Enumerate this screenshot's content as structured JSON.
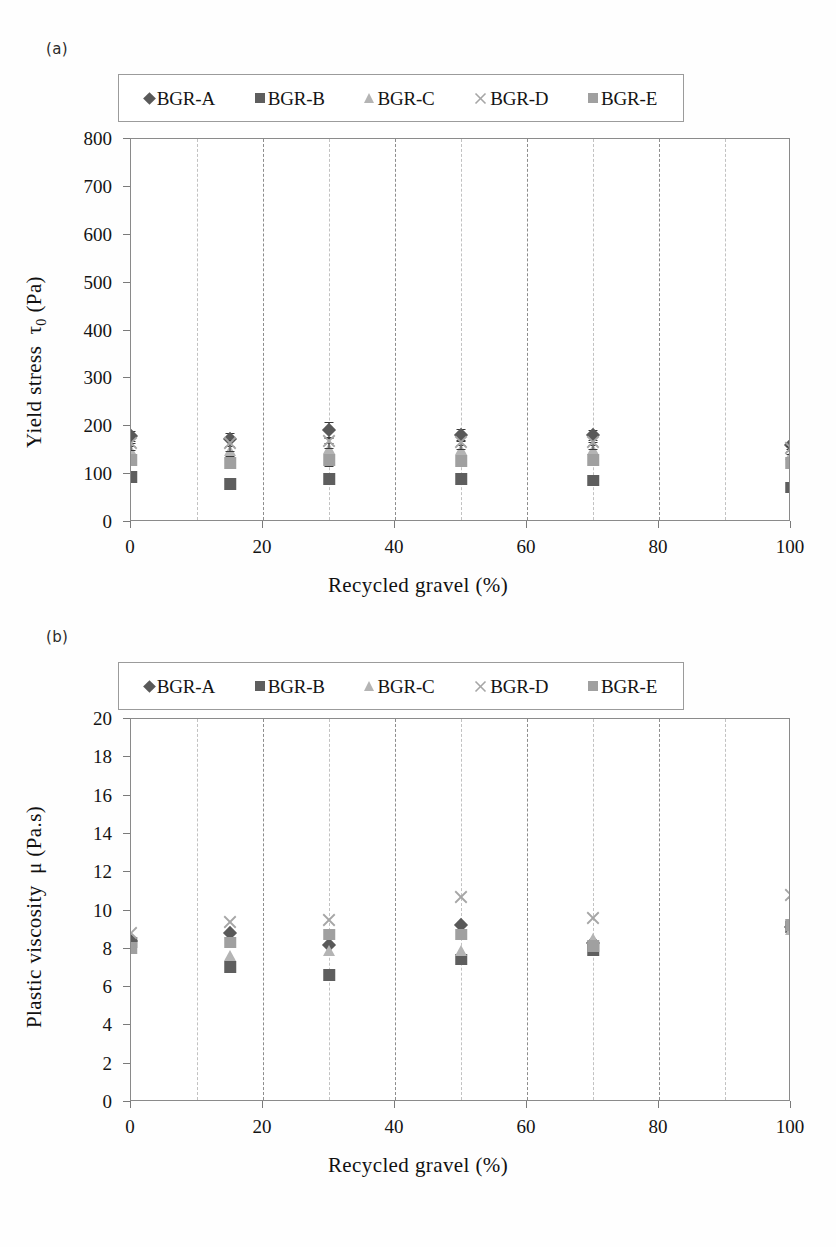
{
  "figure": {
    "panel_a_tag": "(a)",
    "panel_b_tag": "(b)",
    "caption_fragment": ""
  },
  "series_styles": [
    {
      "key": "BGR-A",
      "marker": "diamond",
      "color": "#595959"
    },
    {
      "key": "BGR-B",
      "marker": "square",
      "color": "#5e5e5e"
    },
    {
      "key": "BGR-C",
      "marker": "triangle",
      "color": "#b4b4b4"
    },
    {
      "key": "BGR-D",
      "marker": "x",
      "color": "#a6a6a6"
    },
    {
      "key": "BGR-E",
      "marker": "square",
      "color": "#a0a0a0"
    }
  ],
  "legend": {
    "entries": [
      {
        "label": "BGR-A"
      },
      {
        "label": "BGR-B"
      },
      {
        "label": "BGR-C"
      },
      {
        "label": "BGR-D"
      },
      {
        "label": "BGR-E"
      }
    ]
  },
  "chart_data": [
    {
      "id": "chart-a",
      "type": "scatter",
      "panel": "(a)",
      "title": "",
      "xlabel": "Recycled  gravel (%)",
      "ylabel": "Yield stress  τ0 (Pa)",
      "ylabel_main": "Yield stress",
      "ylabel_symbol": "τ",
      "ylabel_sub": "0",
      "ylabel_unit": "(Pa)",
      "xlim": [
        0,
        100
      ],
      "ylim": [
        0,
        800
      ],
      "xticks": [
        0,
        20,
        40,
        60,
        80,
        100
      ],
      "xtick_labels": [
        "0",
        "20",
        "40",
        "60",
        "80",
        "100"
      ],
      "yticks": [
        0,
        100,
        200,
        300,
        400,
        500,
        600,
        700,
        800
      ],
      "ytick_labels": [
        "0",
        "100",
        "200",
        "300",
        "400",
        "500",
        "600",
        "700",
        "800"
      ],
      "gridlines_x_major": [
        20,
        40,
        60,
        80
      ],
      "gridlines_x_minor": [
        10,
        30,
        50,
        70,
        90
      ],
      "grid": true,
      "legend_position": "top",
      "x": [
        0,
        15,
        30,
        50,
        70,
        100
      ],
      "series": [
        {
          "name": "BGR-A",
          "values": [
            178,
            172,
            192,
            182,
            180,
            160
          ],
          "errors": [
            12,
            14,
            16,
            13,
            12,
            8
          ]
        },
        {
          "name": "BGR-B",
          "values": [
            92,
            78,
            88,
            88,
            85,
            70
          ],
          "errors": [
            8,
            8,
            8,
            8,
            8,
            6
          ]
        },
        {
          "name": "BGR-C",
          "values": [
            148,
            148,
            152,
            150,
            150,
            140
          ],
          "errors": [
            10,
            10,
            12,
            10,
            10,
            8
          ]
        },
        {
          "name": "BGR-D",
          "values": [
            160,
            160,
            166,
            162,
            162,
            150
          ],
          "errors": [
            10,
            12,
            12,
            10,
            10,
            8
          ]
        },
        {
          "name": "BGR-E",
          "values": [
            128,
            122,
            128,
            126,
            128,
            122
          ],
          "errors": [
            9,
            9,
            10,
            9,
            9,
            7
          ]
        }
      ]
    },
    {
      "id": "chart-b",
      "type": "scatter",
      "panel": "(b)",
      "title": "",
      "xlabel": "Recycled  gravel (%)",
      "ylabel": "Plastic viscosity  μ (Pa.s)",
      "ylabel_main": "Plastic viscosity",
      "ylabel_symbol": "μ",
      "ylabel_unit": "(Pa.s)",
      "xlim": [
        0,
        100
      ],
      "ylim": [
        0,
        20
      ],
      "xticks": [
        0,
        20,
        40,
        60,
        80,
        100
      ],
      "xtick_labels": [
        "0",
        "20",
        "40",
        "60",
        "80",
        "100"
      ],
      "yticks": [
        0,
        2,
        4,
        6,
        8,
        10,
        12,
        14,
        16,
        18,
        20
      ],
      "ytick_labels": [
        "0",
        "2",
        "4",
        "6",
        "8",
        "10",
        "12",
        "14",
        "16",
        "18",
        "20"
      ],
      "gridlines_x_major": [
        20,
        40,
        60,
        80
      ],
      "gridlines_x_minor": [
        10,
        30,
        50,
        70,
        90
      ],
      "grid": true,
      "legend_position": "top",
      "x": [
        0,
        15,
        30,
        50,
        70,
        100
      ],
      "series": [
        {
          "name": "BGR-A",
          "values": [
            8.4,
            8.8,
            8.2,
            9.2,
            8.3,
            9.1
          ]
        },
        {
          "name": "BGR-B",
          "values": [
            8.3,
            7.0,
            6.6,
            7.4,
            7.9,
            9.1
          ]
        },
        {
          "name": "BGR-C",
          "values": [
            8.0,
            7.6,
            7.9,
            7.9,
            8.5,
            9.0
          ]
        },
        {
          "name": "BGR-D",
          "values": [
            8.7,
            9.3,
            9.4,
            10.6,
            9.5,
            10.7
          ]
        },
        {
          "name": "BGR-E",
          "values": [
            8.0,
            8.3,
            8.7,
            8.7,
            8.1,
            9.2
          ]
        }
      ]
    }
  ]
}
